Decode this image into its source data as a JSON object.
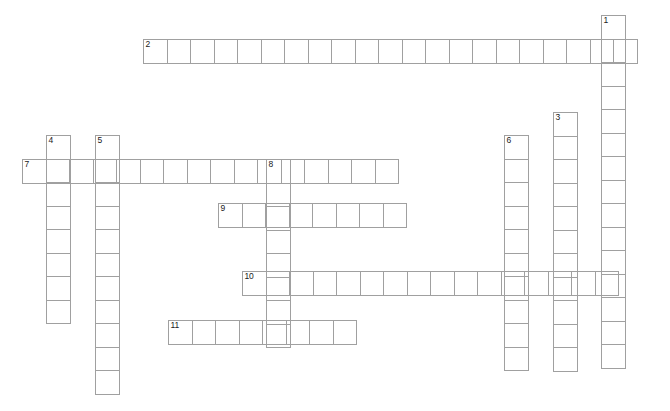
{
  "puzzle": {
    "type": "crossword-grid",
    "background_color": "#ffffff",
    "grid_line_color": "#a0a0a0",
    "number_color": "#1a1a1a",
    "cell_size_px": 24.5,
    "entries": [
      {
        "number": "1",
        "direction": "down",
        "length": 15,
        "left_px": 601,
        "top_px": 15
      },
      {
        "number": "2",
        "direction": "across",
        "length": 21,
        "left_px": 143,
        "top_px": 39
      },
      {
        "number": "3",
        "direction": "down",
        "length": 11,
        "left_px": 553,
        "top_px": 112
      },
      {
        "number": "4",
        "direction": "down",
        "length": 8,
        "left_px": 46,
        "top_px": 135
      },
      {
        "number": "5",
        "direction": "down",
        "length": 11,
        "left_px": 95,
        "top_px": 135
      },
      {
        "number": "6",
        "direction": "down",
        "length": 10,
        "left_px": 504,
        "top_px": 135
      },
      {
        "number": "7",
        "direction": "across",
        "length": 16,
        "left_px": 22,
        "top_px": 159
      },
      {
        "number": "8",
        "direction": "down",
        "length": 8,
        "left_px": 266,
        "top_px": 159
      },
      {
        "number": "9",
        "direction": "across",
        "length": 8,
        "left_px": 218,
        "top_px": 203
      },
      {
        "number": "10",
        "direction": "across",
        "length": 16,
        "left_px": 242,
        "top_px": 271
      },
      {
        "number": "11",
        "direction": "across",
        "length": 8,
        "left_px": 168,
        "top_px": 320
      }
    ]
  }
}
